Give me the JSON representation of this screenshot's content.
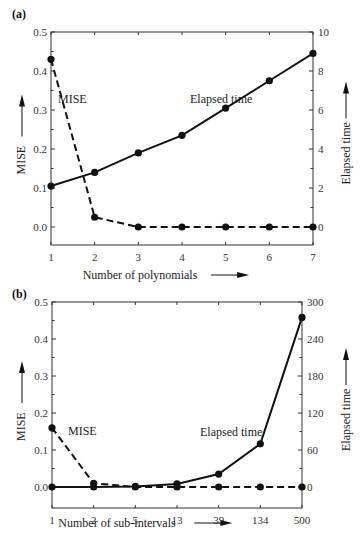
{
  "chart_data": [
    {
      "panel": "(a)",
      "type": "line",
      "xlabel": "Number of polynomials",
      "ylabel_left": "MISE",
      "ylabel_right": "Elapsed time",
      "categories": [
        "1",
        "2",
        "3",
        "4",
        "5",
        "6",
        "7"
      ],
      "ylim_left": [
        -0.05,
        0.5
      ],
      "yticks_left": [
        "0.0",
        "0.1",
        "0.2",
        "0.3",
        "0.4",
        "0.5"
      ],
      "ylim_right": [
        -1,
        10
      ],
      "yticks_right": [
        "0",
        "2",
        "4",
        "6",
        "8",
        "10"
      ],
      "grid": false,
      "series": [
        {
          "name": "MISE",
          "axis": "left",
          "style": "dashed",
          "values": [
            0.43,
            0.025,
            0.0,
            0.0,
            0.0,
            0.0,
            0.0
          ]
        },
        {
          "name": "Elapsed time",
          "axis": "right",
          "style": "solid",
          "values": [
            2.1,
            2.8,
            3.8,
            4.7,
            6.1,
            7.5,
            8.9
          ]
        }
      ],
      "annotations": [
        "MISE",
        "Elapsed time"
      ]
    },
    {
      "panel": "(b)",
      "type": "line",
      "xlabel": "Number of sub-intervals",
      "ylabel_left": "MISE",
      "ylabel_right": "Elapsed time",
      "categories": [
        "1",
        "2",
        "5",
        "13",
        "39",
        "134",
        "500"
      ],
      "ylim_left": [
        -0.05,
        0.5
      ],
      "yticks_left": [
        "0.0",
        "0.1",
        "0.2",
        "0.3",
        "0.4",
        "0.5"
      ],
      "ylim_right": [
        -30,
        300
      ],
      "yticks_right": [
        "0",
        "60",
        "120",
        "180",
        "240",
        "300"
      ],
      "grid": false,
      "series": [
        {
          "name": "MISE",
          "axis": "left",
          "style": "dashed",
          "values": [
            0.16,
            0.01,
            0.0,
            0.0,
            0.0,
            0.0,
            0.0
          ]
        },
        {
          "name": "Elapsed time",
          "axis": "right",
          "style": "solid",
          "values": [
            0,
            0,
            1,
            5,
            21,
            70,
            275
          ]
        }
      ],
      "annotations": [
        "MISE",
        "Elapsed time"
      ]
    }
  ]
}
